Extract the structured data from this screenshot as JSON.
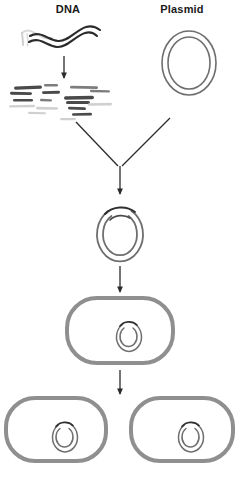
{
  "figure": {
    "width": 240,
    "height": 484,
    "background_color": "#ffffff"
  },
  "labels": {
    "dna": "DNA",
    "plasmid": "Plasmid"
  },
  "colors": {
    "text": "#1a1a1a",
    "dna_strand_dark": "#2b2b2b",
    "dna_strand_faded": "#d8d8d8",
    "fragment_dark": "#4a4a4a",
    "fragment_mid": "#7d7d7d",
    "fragment_light": "#d0d0d0",
    "plasmid_outline": "#6e6e6e",
    "insert_arc": "#2f2f2f",
    "cell_wall": "#8f8f8f",
    "cell_fill": "#ffffff",
    "arrow": "#2b2b2b"
  },
  "stages": [
    {
      "id": "dna-source",
      "name": "DNA",
      "description": "Double-stranded wavy genomic DNA molecule"
    },
    {
      "id": "plasmid-source",
      "name": "Plasmid",
      "description": "Circular double-ringed plasmid vector"
    },
    {
      "id": "dna-fragments",
      "name": "DNA fragments",
      "description": "Digested DNA cut into linear fragments of varying length"
    },
    {
      "id": "recombinant-plasmid",
      "name": "Recombinant plasmid",
      "description": "Plasmid with DNA insert ligated into opened site"
    },
    {
      "id": "transformed-cell",
      "name": "Transformed bacterial cell",
      "description": "Bacterium containing the recombinant plasmid"
    },
    {
      "id": "daughter-cell-left",
      "name": "Daughter cell (left)",
      "description": "Divided bacterial cell carrying a copy of the plasmid"
    },
    {
      "id": "daughter-cell-right",
      "name": "Daughter cell (right)",
      "description": "Divided bacterial cell carrying a copy of the plasmid"
    }
  ],
  "arrows": [
    {
      "id": "arrow-dna-digest",
      "from": "dna-source",
      "to": "dna-fragments",
      "direction": "down"
    },
    {
      "id": "arrow-fragments-ligate",
      "from": "dna-fragments",
      "to": "recombinant-plasmid",
      "direction": "down-right"
    },
    {
      "id": "arrow-plasmid-ligate",
      "from": "plasmid-source",
      "to": "recombinant-plasmid",
      "direction": "down-left"
    },
    {
      "id": "arrow-ligation-join",
      "from": "ligation-junction",
      "to": "recombinant-plasmid",
      "direction": "down"
    },
    {
      "id": "arrow-transform",
      "from": "recombinant-plasmid",
      "to": "transformed-cell",
      "direction": "down"
    },
    {
      "id": "arrow-divide",
      "from": "transformed-cell",
      "to": "daughter-cells",
      "direction": "down"
    }
  ],
  "fragments": [
    {
      "x": 14,
      "y": 86,
      "w": 28,
      "h": 3.2,
      "rot": -2,
      "shade": "fragment_dark"
    },
    {
      "x": 44,
      "y": 84,
      "w": 14,
      "h": 2.6,
      "rot": 0,
      "shade": "fragment_mid"
    },
    {
      "x": 10,
      "y": 92,
      "w": 22,
      "h": 2.8,
      "rot": 1,
      "shade": "fragment_dark"
    },
    {
      "x": 42,
      "y": 91,
      "w": 18,
      "h": 2.8,
      "rot": -1,
      "shade": "fragment_dark"
    },
    {
      "x": 13,
      "y": 99,
      "w": 20,
      "h": 2.6,
      "rot": 0,
      "shade": "fragment_dark"
    },
    {
      "x": 40,
      "y": 99,
      "w": 12,
      "h": 2.4,
      "rot": 2,
      "shade": "fragment_mid"
    },
    {
      "x": 9,
      "y": 105,
      "w": 26,
      "h": 2.4,
      "rot": -1,
      "shade": "fragment_light"
    },
    {
      "x": 36,
      "y": 107,
      "w": 22,
      "h": 2.6,
      "rot": 1,
      "shade": "fragment_light"
    },
    {
      "x": 64,
      "y": 96,
      "w": 30,
      "h": 3.4,
      "rot": -1,
      "shade": "fragment_dark"
    },
    {
      "x": 70,
      "y": 86,
      "w": 28,
      "h": 2.8,
      "rot": 1,
      "shade": "fragment_mid"
    },
    {
      "x": 66,
      "y": 101,
      "w": 24,
      "h": 3.0,
      "rot": 0,
      "shade": "fragment_dark"
    },
    {
      "x": 68,
      "y": 107,
      "w": 18,
      "h": 2.8,
      "rot": 2,
      "shade": "fragment_dark"
    },
    {
      "x": 72,
      "y": 113,
      "w": 20,
      "h": 2.6,
      "rot": -1,
      "shade": "fragment_dark"
    },
    {
      "x": 90,
      "y": 90,
      "w": 20,
      "h": 2.4,
      "rot": 1,
      "shade": "fragment_mid"
    },
    {
      "x": 88,
      "y": 103,
      "w": 24,
      "h": 2.6,
      "rot": -1,
      "shade": "fragment_light"
    },
    {
      "x": 60,
      "y": 118,
      "w": 16,
      "h": 2.2,
      "rot": 0,
      "shade": "fragment_light"
    },
    {
      "x": 28,
      "y": 112,
      "w": 18,
      "h": 2.2,
      "rot": 1,
      "shade": "fragment_light"
    }
  ]
}
